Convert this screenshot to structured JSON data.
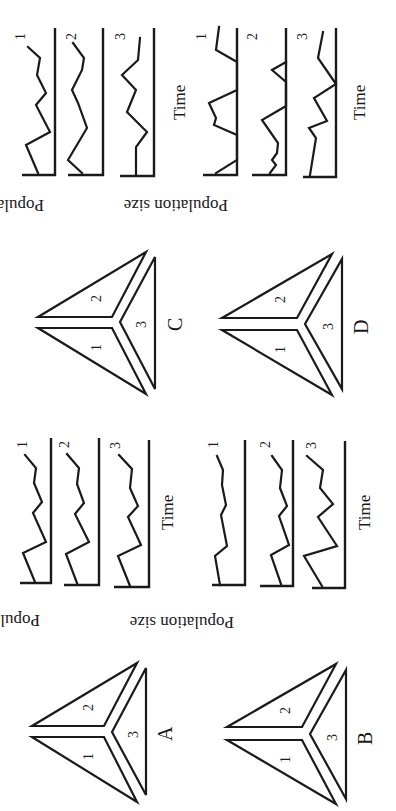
{
  "figure": {
    "orientation": "page rotated 90 degrees counterclockwise",
    "panels": [
      {
        "id": "A",
        "label": "A",
        "patch_labels": [
          "1",
          "2",
          "3"
        ],
        "series_labels": [
          "1",
          "2",
          "3"
        ],
        "x_axis_label": "Time",
        "y_axis_label": "Population size",
        "description": "Three patches with nearly identical synchronous fluctuations"
      },
      {
        "id": "B",
        "label": "B",
        "patch_labels": [
          "1",
          "2",
          "3"
        ],
        "series_labels": [
          "1",
          "2",
          "3"
        ],
        "x_axis_label": "Time",
        "y_axis_label": "Population size",
        "description": "Partially correlated fluctuations, patch 3 more variable"
      },
      {
        "id": "C",
        "label": "C",
        "patch_labels": [
          "1",
          "2",
          "3"
        ],
        "series_labels": [
          "1",
          "2",
          "3"
        ],
        "x_axis_label": "Time",
        "y_axis_label": "Population size",
        "description": "Asynchronous fluctuations among patches"
      },
      {
        "id": "D",
        "label": "D",
        "patch_labels": [
          "1",
          "2",
          "3"
        ],
        "series_labels": [
          "1",
          "2",
          "3"
        ],
        "x_axis_label": "Time",
        "y_axis_label": "Population size",
        "description": "Local extinctions (populations hitting zero) with recolonization"
      }
    ]
  },
  "labels": {
    "time": "Time",
    "population_size": "Population size",
    "one": "1",
    "two": "2",
    "three": "3",
    "A": "A",
    "B": "B",
    "C": "C",
    "D": "D"
  },
  "colors": {
    "ink": "#1a1a1a",
    "background": "#ffffff"
  }
}
